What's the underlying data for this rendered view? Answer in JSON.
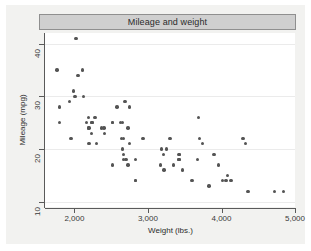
{
  "figure": {
    "title": "Mileage and weight",
    "background": "#f2f2f0",
    "title_bar_color": "#cfcfcf",
    "plot_background": "#ffffff",
    "marker_color": "#545454"
  },
  "chart_data": {
    "type": "scatter",
    "title": "Mileage and weight",
    "xlabel": "Weight (lbs.)",
    "ylabel": "Mileage (mpg)",
    "xlim": [
      1600,
      5000
    ],
    "ylim": [
      9,
      42
    ],
    "xticks": [
      2000,
      3000,
      4000,
      5000
    ],
    "xticklabels": [
      "2,000",
      "3,000",
      "4,000",
      "5,000"
    ],
    "yticks": [
      10,
      20,
      30,
      40
    ],
    "yticklabels": [
      "10",
      "20",
      "30",
      "40"
    ],
    "grid": "horizontal",
    "legend": null,
    "series": [
      {
        "name": "Mileage vs Weight",
        "marker": "circle",
        "color": "#545454",
        "x": [
          2930,
          3350,
          2640,
          3250,
          4080,
          3670,
          3690,
          3180,
          3220,
          3430,
          3210,
          4060,
          3600,
          3740,
          4130,
          4330,
          3900,
          4290,
          2110,
          2200,
          2690,
          3470,
          3300,
          3700,
          3955,
          3830,
          4010,
          4360,
          1800,
          1800,
          1955,
          2580,
          2200,
          2520,
          2650,
          1760,
          2730,
          2010,
          2020,
          2190,
          2240,
          2520,
          2650,
          2700,
          2750,
          2830,
          1930,
          1990,
          2300,
          2400,
          2730,
          2830,
          2370,
          2280,
          2750,
          2120,
          2160,
          2670,
          2230,
          2190,
          2050,
          2410,
          2520,
          2670,
          2240,
          2670,
          2630,
          3420,
          3170,
          3420,
          4720,
          4840,
          2830,
          3420
        ],
        "y": [
          22,
          17,
          22,
          20,
          15,
          18,
          26,
          20,
          16,
          19,
          19,
          14,
          14,
          21,
          14,
          21,
          19,
          22,
          35,
          24,
          29,
          16,
          22,
          22,
          17,
          13,
          14,
          12,
          28,
          25,
          22,
          28,
          21,
          17,
          20,
          35,
          24,
          30,
          41,
          24,
          25,
          25,
          25,
          18,
          21,
          18,
          29,
          31,
          21,
          24,
          17,
          14,
          24,
          26,
          28,
          30,
          25,
          22,
          23,
          26,
          34,
          23,
          25,
          18,
          25,
          19,
          25,
          18,
          17,
          19,
          12,
          12,
          14,
          18
        ]
      }
    ]
  },
  "axes": {
    "x": {
      "title": "Weight (lbs.)",
      "tick_labels": [
        "2,000",
        "3,000",
        "4,000",
        "5,000"
      ]
    },
    "y": {
      "title": "Mileage (mpg)",
      "tick_labels": [
        "10",
        "20",
        "30",
        "40"
      ]
    }
  }
}
